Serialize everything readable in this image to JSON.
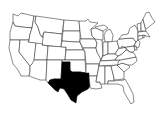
{
  "map": {
    "title": "United States map with Texas highlighted",
    "region": "Contiguous United States",
    "highlighted_state": "Texas",
    "colors": {
      "background": "#ffffff",
      "outline": "#2a2a2a",
      "highlight": "#000000",
      "default_fill": "#ffffff"
    },
    "states": [
      {
        "name": "Washington",
        "highlighted": false
      },
      {
        "name": "Oregon",
        "highlighted": false
      },
      {
        "name": "California",
        "highlighted": false
      },
      {
        "name": "Idaho",
        "highlighted": false
      },
      {
        "name": "Nevada",
        "highlighted": false
      },
      {
        "name": "Montana",
        "highlighted": false
      },
      {
        "name": "Wyoming",
        "highlighted": false
      },
      {
        "name": "Utah",
        "highlighted": false
      },
      {
        "name": "Arizona",
        "highlighted": false
      },
      {
        "name": "Colorado",
        "highlighted": false
      },
      {
        "name": "New Mexico",
        "highlighted": false
      },
      {
        "name": "North Dakota",
        "highlighted": false
      },
      {
        "name": "South Dakota",
        "highlighted": false
      },
      {
        "name": "Nebraska",
        "highlighted": false
      },
      {
        "name": "Kansas",
        "highlighted": false
      },
      {
        "name": "Oklahoma",
        "highlighted": false
      },
      {
        "name": "Texas",
        "highlighted": true
      },
      {
        "name": "Minnesota",
        "highlighted": false
      },
      {
        "name": "Iowa",
        "highlighted": false
      },
      {
        "name": "Missouri",
        "highlighted": false
      },
      {
        "name": "Arkansas",
        "highlighted": false
      },
      {
        "name": "Louisiana",
        "highlighted": false
      },
      {
        "name": "Wisconsin",
        "highlighted": false
      },
      {
        "name": "Illinois",
        "highlighted": false
      },
      {
        "name": "Michigan",
        "highlighted": false
      },
      {
        "name": "Indiana",
        "highlighted": false
      },
      {
        "name": "Ohio",
        "highlighted": false
      },
      {
        "name": "Kentucky",
        "highlighted": false
      },
      {
        "name": "Tennessee",
        "highlighted": false
      },
      {
        "name": "Mississippi",
        "highlighted": false
      },
      {
        "name": "Alabama",
        "highlighted": false
      },
      {
        "name": "Georgia",
        "highlighted": false
      },
      {
        "name": "Florida",
        "highlighted": false
      },
      {
        "name": "South Carolina",
        "highlighted": false
      },
      {
        "name": "North Carolina",
        "highlighted": false
      },
      {
        "name": "Virginia",
        "highlighted": false
      },
      {
        "name": "West Virginia",
        "highlighted": false
      },
      {
        "name": "Pennsylvania",
        "highlighted": false
      },
      {
        "name": "New York",
        "highlighted": false
      },
      {
        "name": "Maryland",
        "highlighted": false
      },
      {
        "name": "Delaware",
        "highlighted": false
      },
      {
        "name": "New Jersey",
        "highlighted": false
      },
      {
        "name": "Connecticut",
        "highlighted": false
      },
      {
        "name": "Rhode Island",
        "highlighted": false
      },
      {
        "name": "Massachusetts",
        "highlighted": false
      },
      {
        "name": "Vermont",
        "highlighted": false
      },
      {
        "name": "New Hampshire",
        "highlighted": false
      },
      {
        "name": "Maine",
        "highlighted": false
      }
    ]
  }
}
